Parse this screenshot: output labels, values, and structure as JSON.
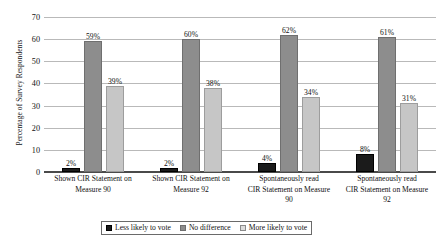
{
  "chart_data": {
    "type": "bar",
    "title": "",
    "subtitle": "",
    "xlabel": "",
    "ylabel": "Percentage of Survey Respondents",
    "ylim": [
      0,
      70
    ],
    "ytick_step": 10,
    "yticks": [
      "0",
      "10",
      "20",
      "30",
      "40",
      "50",
      "60",
      "70"
    ],
    "grid": true,
    "legend_position": "bottom",
    "categories": [
      "Shown CIR Statement on Measure 90",
      "Shown CIR Statement on Measure 92",
      "Spontaneously read CIR Statement on Measure 90",
      "Spontaneously read CIR Statement on Measure 92"
    ],
    "category_lines": [
      [
        "Shown CIR Statement on",
        "Measure 90"
      ],
      [
        "Shown CIR Statement on",
        "Measure 92"
      ],
      [
        "Spontaneously read",
        "CIR Statement on Measure",
        "90"
      ],
      [
        "Spontaneously read",
        "CIR Statement on Measure",
        "92"
      ]
    ],
    "series": [
      {
        "name": "Less likely to vote",
        "color": "#1b1b1b",
        "values": [
          2,
          2,
          4,
          8
        ],
        "labels": [
          "2%",
          "2%",
          "4%",
          "8%"
        ]
      },
      {
        "name": "No difference",
        "color": "#8d8d8d",
        "values": [
          59,
          60,
          62,
          61
        ],
        "labels": [
          "59%",
          "60%",
          "62%",
          "61%"
        ]
      },
      {
        "name": "More likely to vote",
        "color": "#c6c6c6",
        "values": [
          39,
          38,
          34,
          31
        ],
        "labels": [
          "39%",
          "38%",
          "34%",
          "31%"
        ]
      }
    ]
  }
}
